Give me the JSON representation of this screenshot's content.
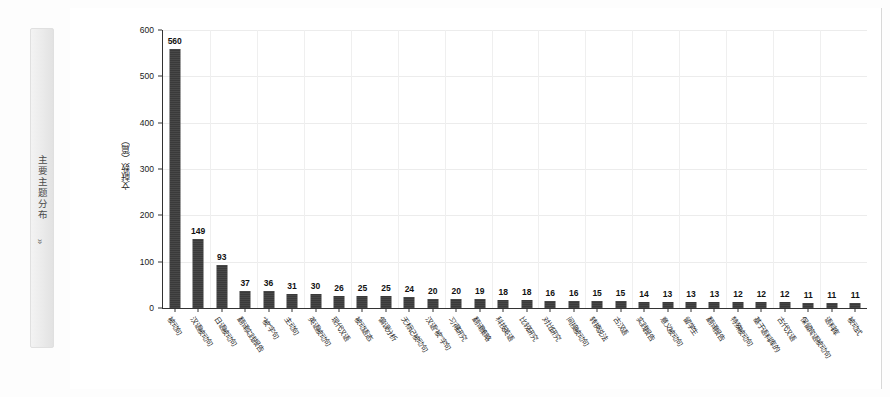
{
  "sidebar": {
    "label": "主要主题分布",
    "expand_icon": "»"
  },
  "chart_data": {
    "type": "bar",
    "title": "",
    "xlabel": "",
    "ylabel": "文献数（篇）",
    "ylim": [
      0,
      600
    ],
    "yticks": [
      0,
      100,
      200,
      300,
      400,
      500,
      600
    ],
    "grid": true,
    "legend": null,
    "categories": [
      "被动句",
      "汉语被动句",
      "日语被动句",
      "翻译实践报告",
      "“被”字句",
      "主动句",
      "英语被动句",
      "现代汉语",
      "被动语态",
      "偏误分析",
      "无标记被动句",
      "汉语“被”字句",
      "习得研究",
      "翻译策略",
      "科技英语",
      "比较研究",
      "对比研究",
      "间接被动句",
      "转换说法",
      "古汉语",
      "实践报告",
      "意义被动句",
      "留学生",
      "翻译报告",
      "特殊被动句",
      "基于语料库的",
      "古代汉语",
      "保留宾语被动句",
      "语料库",
      "被动式"
    ],
    "values": [
      560,
      149,
      93,
      37,
      36,
      31,
      30,
      26,
      25,
      25,
      24,
      20,
      20,
      19,
      18,
      18,
      16,
      16,
      15,
      15,
      14,
      13,
      13,
      13,
      12,
      12,
      12,
      11,
      11,
      11
    ]
  }
}
